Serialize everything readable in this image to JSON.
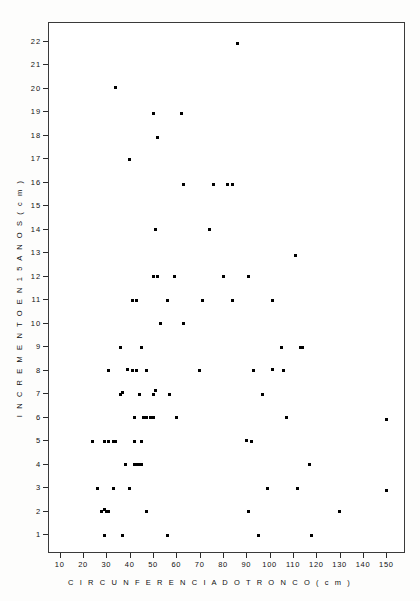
{
  "figure": {
    "background_color": "#fdfdfc",
    "frame_color": "#3a3a3a",
    "point_color": "#000000"
  },
  "axes": {
    "x_title": "C I R C U N F E R E N C I A   D O   T R O N C O   ( c m )",
    "y_title": "I N C R E M E N T O   E N   1 5   A N O S    ( c m )"
  },
  "chart_data": {
    "type": "scatter",
    "title": "",
    "subtitle": "",
    "xlabel": "CIRCUNFERENCIA DO TRONCO (cm)",
    "ylabel": "INCREMENTO EN 15 ANOS (cm)",
    "xlim": [
      5,
      158
    ],
    "ylim": [
      0.2,
      22.8
    ],
    "xticks": [
      10,
      20,
      30,
      40,
      50,
      60,
      70,
      80,
      90,
      100,
      110,
      120,
      130,
      140,
      150
    ],
    "yticks": [
      1,
      2,
      3,
      4,
      5,
      6,
      7,
      8,
      9,
      10,
      11,
      12,
      13,
      14,
      15,
      16,
      17,
      18,
      19,
      20,
      21,
      22
    ],
    "xtick_labels": [
      "10",
      "20",
      "30",
      "40",
      "50",
      "60",
      "70",
      "80",
      "90",
      "100",
      "110",
      "120",
      "130",
      "140",
      "150"
    ],
    "ytick_labels": [
      "1",
      "2",
      "3",
      "4",
      "5",
      "6",
      "7",
      "8",
      "9",
      "10",
      "11",
      "12",
      "13",
      "14",
      "15",
      "16",
      "17",
      "18",
      "19",
      "20",
      "21",
      "22"
    ],
    "grid": false,
    "legend": null,
    "marker": "square",
    "marker_size_px": 3,
    "n_points": 118,
    "points": [
      [
        86,
        21.9
      ],
      [
        34,
        20.0
      ],
      [
        50,
        18.9
      ],
      [
        62,
        18.9
      ],
      [
        52,
        17.9
      ],
      [
        40,
        16.95
      ],
      [
        63,
        15.9
      ],
      [
        76,
        15.9
      ],
      [
        82,
        15.9
      ],
      [
        84,
        15.9
      ],
      [
        51,
        13.95
      ],
      [
        74,
        13.95
      ],
      [
        111,
        12.85
      ],
      [
        50,
        11.95
      ],
      [
        52,
        11.95
      ],
      [
        59,
        11.95
      ],
      [
        80,
        11.95
      ],
      [
        91,
        11.95
      ],
      [
        41,
        10.95
      ],
      [
        43,
        10.95
      ],
      [
        56,
        10.95
      ],
      [
        71,
        10.95
      ],
      [
        84,
        10.95
      ],
      [
        101,
        10.95
      ],
      [
        53,
        9.95
      ],
      [
        63,
        9.95
      ],
      [
        36,
        8.95
      ],
      [
        45,
        8.95
      ],
      [
        105,
        8.95
      ],
      [
        113,
        8.95
      ],
      [
        114,
        8.95
      ],
      [
        31,
        7.95
      ],
      [
        39,
        8.0
      ],
      [
        41,
        7.95
      ],
      [
        43,
        7.95
      ],
      [
        47,
        7.95
      ],
      [
        70,
        7.95
      ],
      [
        93,
        7.95
      ],
      [
        101,
        8.0
      ],
      [
        106,
        7.95
      ],
      [
        36,
        6.95
      ],
      [
        37,
        7.05
      ],
      [
        44,
        6.95
      ],
      [
        50,
        6.95
      ],
      [
        51,
        7.1
      ],
      [
        57,
        6.95
      ],
      [
        97,
        6.95
      ],
      [
        42,
        5.95
      ],
      [
        46,
        5.95
      ],
      [
        47,
        5.95
      ],
      [
        49,
        5.95
      ],
      [
        50,
        5.95
      ],
      [
        60,
        5.95
      ],
      [
        107,
        5.95
      ],
      [
        150,
        5.9
      ],
      [
        24,
        4.95
      ],
      [
        29,
        4.95
      ],
      [
        31,
        4.95
      ],
      [
        33,
        4.95
      ],
      [
        34,
        4.95
      ],
      [
        42,
        4.95
      ],
      [
        45,
        4.95
      ],
      [
        90,
        5.0
      ],
      [
        92,
        4.95
      ],
      [
        38,
        3.95
      ],
      [
        42,
        3.95
      ],
      [
        43,
        3.95
      ],
      [
        44,
        3.95
      ],
      [
        45,
        3.95
      ],
      [
        117,
        3.95
      ],
      [
        26,
        2.95
      ],
      [
        33,
        2.95
      ],
      [
        40,
        2.95
      ],
      [
        99,
        2.95
      ],
      [
        112,
        2.95
      ],
      [
        150,
        2.85
      ],
      [
        28,
        1.95
      ],
      [
        29,
        2.05
      ],
      [
        30,
        1.95
      ],
      [
        31,
        1.95
      ],
      [
        47,
        1.95
      ],
      [
        91,
        1.95
      ],
      [
        130,
        1.95
      ],
      [
        29,
        0.95
      ],
      [
        37,
        0.95
      ],
      [
        56,
        0.95
      ],
      [
        95,
        0.95
      ],
      [
        118,
        0.95
      ]
    ]
  }
}
